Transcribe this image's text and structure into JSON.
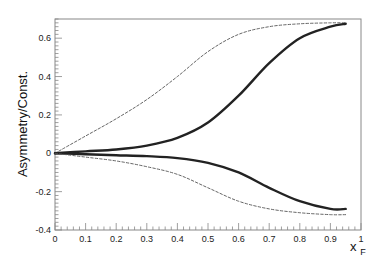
{
  "chart_data": {
    "type": "line",
    "title": "",
    "xlabel": "x_F",
    "xlabel_main": "x",
    "xlabel_sub": "F",
    "ylabel": "Asymmetry/Const.",
    "xlim": [
      0,
      1
    ],
    "ylim": [
      -0.4,
      0.7
    ],
    "grid": false,
    "legend": null,
    "x_ticks": [
      "0",
      "0.1",
      "0.2",
      "0.3",
      "0.4",
      "0.5",
      "0.6",
      "0.7",
      "0.8",
      "0.9",
      "1"
    ],
    "y_ticks": [
      "-0.4",
      "-0.2",
      "0",
      "0.2",
      "0.4",
      "0.6"
    ],
    "x": [
      0,
      0.1,
      0.2,
      0.3,
      0.4,
      0.5,
      0.6,
      0.7,
      0.8,
      0.9,
      0.95
    ],
    "series": [
      {
        "name": "upper-dashed",
        "style": "dashed",
        "values": [
          0,
          0.09,
          0.18,
          0.28,
          0.4,
          0.53,
          0.62,
          0.66,
          0.675,
          0.68,
          0.68
        ]
      },
      {
        "name": "upper-solid",
        "style": "solid",
        "values": [
          0,
          0.01,
          0.02,
          0.04,
          0.08,
          0.16,
          0.3,
          0.47,
          0.6,
          0.66,
          0.675
        ]
      },
      {
        "name": "lower-solid",
        "style": "solid",
        "values": [
          0,
          -0.005,
          -0.01,
          -0.015,
          -0.025,
          -0.05,
          -0.1,
          -0.18,
          -0.25,
          -0.29,
          -0.29
        ]
      },
      {
        "name": "lower-dashed",
        "style": "dashed",
        "values": [
          0,
          -0.02,
          -0.04,
          -0.07,
          -0.11,
          -0.18,
          -0.25,
          -0.29,
          -0.31,
          -0.32,
          -0.32
        ]
      }
    ]
  },
  "colors": {
    "frame": "#888888",
    "solid_line": "#222222",
    "dashed_line": "#555555",
    "text": "#222222"
  }
}
